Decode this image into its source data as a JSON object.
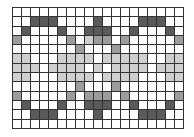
{
  "diagram": {
    "title": "",
    "columns": 19,
    "rows": 13,
    "legend": {
      "D": "#5a5a5a",
      "M": "#9c9c9c",
      "L": "#cfcfcf",
      "W": "#ffffff"
    },
    "grid": [
      "WWWWWWWWWWWWWWWWWWW",
      "WWDDDWWWWDWWWWDDDWW",
      "WDWWWDWWDDDWWDWWWDW",
      "MWWWWWMWLMMWMWWWWWM",
      "WWWWWWWMWWWMWWWWWWW",
      "LLWWWLLLLWLLLLLWWLL",
      "LLLWLLLLWLWLLLLWLLL",
      "LLWWWLLLLWLLLLWWWLL",
      "WWWWWWWMWWWMWWWWWWW",
      "MWWWWWMWMMMWMWWWWWM",
      "WDWWWDWWDDDWWDWWWDW",
      "WWDDDWWWWDWWWWDDDWW",
      "WWWWWWWWWWWWWWWWWWW"
    ]
  }
}
